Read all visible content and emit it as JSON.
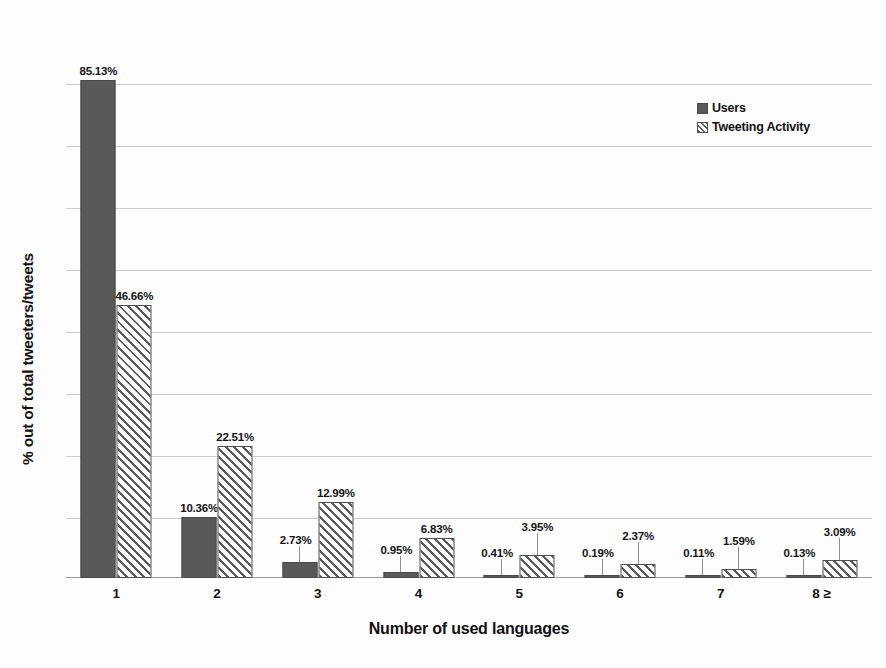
{
  "chart_data": {
    "type": "bar",
    "title": "",
    "xlabel": "Number of used languages",
    "ylabel": "% out of total tweeters/tweets",
    "categories": [
      "1",
      "2",
      "3",
      "4",
      "5",
      "6",
      "7",
      "8 ≥"
    ],
    "series": [
      {
        "name": "Users",
        "values": [
          85.13,
          10.36,
          2.73,
          0.95,
          0.41,
          0.19,
          0.11,
          0.13
        ],
        "labels": [
          "85.13%",
          "10.36%",
          "2.73%",
          "0.95%",
          "0.41%",
          "0.19%",
          "0.11%",
          "0.13%"
        ],
        "style": "solid",
        "color": "#595959"
      },
      {
        "name": "Tweeting Activity",
        "values": [
          46.66,
          22.51,
          12.99,
          6.83,
          3.95,
          2.37,
          1.59,
          3.09
        ],
        "labels": [
          "46.66%",
          "22.51%",
          "12.99%",
          "6.83%",
          "3.95%",
          "2.37%",
          "1.59%",
          "3.09%"
        ],
        "style": "diagonal-hatch",
        "color": "#ffffff"
      }
    ],
    "ylim": [
      0,
      95
    ],
    "grid": true,
    "gridline_count": 8,
    "legend_position": "top-right",
    "axis_tick_labels_visible": false
  },
  "legend": {
    "items": [
      {
        "label": "Users",
        "key": "solid-square-key"
      },
      {
        "label": "Tweeting Activity",
        "key": "hatched-square-key"
      }
    ]
  },
  "axes": {
    "x_title": "Number of used languages",
    "y_title": "% out of total tweeters/tweets"
  }
}
